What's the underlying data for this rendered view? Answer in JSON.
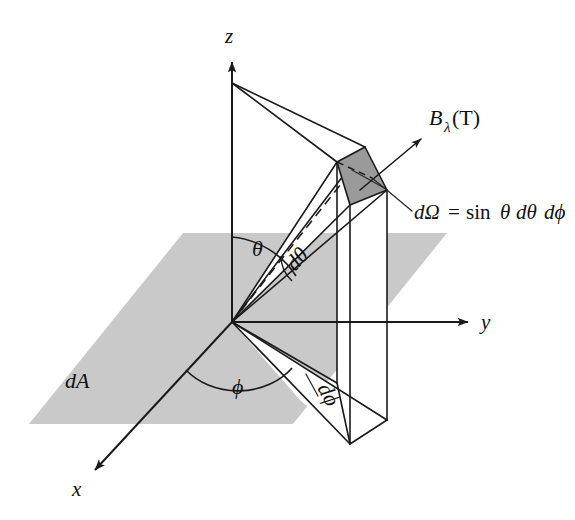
{
  "figure": {
    "kind": "3d-geometry-diagram",
    "background_color": "#ffffff",
    "line_color": "#1a1a1a",
    "plane_fill": "#c9c9c9",
    "patch_fill": "#9a9a9a"
  },
  "axes": {
    "z_label": "z",
    "y_label": "y",
    "x_label": "x",
    "origin_label": "O"
  },
  "labels": {
    "area_element": "dA",
    "theta": "θ",
    "d_theta": "dθ",
    "phi": "ϕ",
    "d_phi": "dϕ",
    "intensity_b": "B",
    "intensity_sub": "λ",
    "intensity_arg": "(T)",
    "solid_angle_lhs": "dΩ",
    "solid_angle_eq": "=",
    "solid_angle_sin": "sin",
    "solid_angle_theta": "θ",
    "solid_angle_dtheta": "dθ",
    "solid_angle_dphi": "dϕ",
    "solid_angle_full": "dΩ = sin θ dθ dϕ"
  }
}
